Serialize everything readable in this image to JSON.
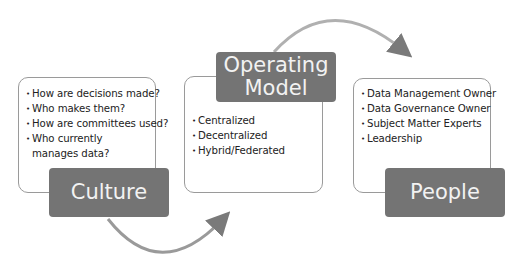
{
  "diagram": {
    "nodes": [
      {
        "id": "culture",
        "label": "Culture",
        "items": [
          "How are decisions made?",
          "Who makes them?",
          "How are committees used?",
          "Who currently manages data?"
        ]
      },
      {
        "id": "operating-model",
        "label": "Operating Model",
        "label_lines": [
          "Operating",
          "Model"
        ],
        "items": [
          "Centralized",
          "Decentralized",
          "Hybrid/Federated"
        ]
      },
      {
        "id": "people",
        "label": "People",
        "items": [
          "Data Management Owner",
          "Data Governance Owner",
          "Subject Matter Experts",
          "Leadership"
        ]
      }
    ],
    "edges": [
      {
        "from": "culture",
        "to": "operating-model"
      },
      {
        "from": "operating-model",
        "to": "people"
      }
    ],
    "colors": {
      "label_fill": "#747474",
      "label_text": "#f2f2f2",
      "box_border": "#9a9a9a",
      "arrow": "#8a8a8a"
    }
  }
}
